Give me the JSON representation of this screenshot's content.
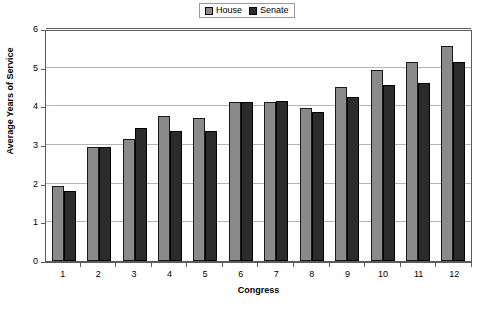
{
  "chart_data": {
    "type": "bar",
    "title": "",
    "xlabel": "Congress",
    "ylabel": "Average Years of Service",
    "categories": [
      "1",
      "2",
      "3",
      "4",
      "5",
      "6",
      "7",
      "8",
      "9",
      "10",
      "11",
      "12"
    ],
    "series": [
      {
        "name": "House",
        "color": "#8a8a8a",
        "values": [
          1.95,
          2.95,
          3.15,
          3.75,
          3.7,
          4.1,
          4.1,
          3.95,
          4.5,
          4.95,
          5.15,
          5.55
        ]
      },
      {
        "name": "Senate",
        "color": "#2b2b2b",
        "values": [
          1.8,
          2.95,
          3.45,
          3.35,
          3.35,
          4.1,
          4.15,
          3.85,
          4.25,
          4.55,
          4.6,
          5.15
        ]
      }
    ],
    "ylim": [
      0,
      6
    ],
    "ytick_labels": [
      "0",
      "1",
      "2",
      "3",
      "4",
      "5",
      "6"
    ],
    "yticks": [
      0,
      1,
      2,
      3,
      4,
      5,
      6
    ],
    "grid": true,
    "legend_position": "top-center"
  },
  "legend": {
    "entries": [
      {
        "label": "House",
        "color": "#8a8a8a"
      },
      {
        "label": "Senate",
        "color": "#2b2b2b"
      }
    ]
  }
}
